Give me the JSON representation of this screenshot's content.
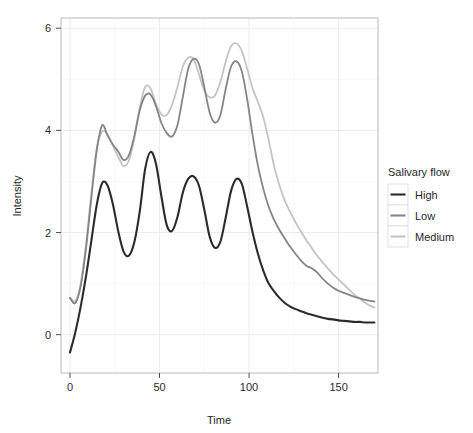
{
  "chart_data": {
    "type": "line",
    "title": "",
    "xlabel": "Time",
    "ylabel": "Intensity",
    "xlim": [
      -5,
      172
    ],
    "ylim": [
      -0.75,
      6.2
    ],
    "xticks": [
      0,
      50,
      100,
      150
    ],
    "yticks": [
      0,
      2,
      4,
      6
    ],
    "xtick_labels": [
      "0",
      "50",
      "100",
      "150"
    ],
    "ytick_labels": [
      "0",
      "2",
      "4",
      "6"
    ],
    "grid": true,
    "legend_position": "right",
    "legend_title": "Salivary flow",
    "colors": {
      "High": "#2b2b2b",
      "Low": "#858585",
      "Medium": "#c4c4c4"
    },
    "x": [
      0,
      3,
      6,
      9,
      12,
      15,
      18,
      21,
      24,
      27,
      30,
      33,
      36,
      39,
      42,
      45,
      48,
      51,
      54,
      57,
      60,
      63,
      66,
      69,
      72,
      75,
      78,
      81,
      84,
      87,
      90,
      93,
      96,
      99,
      102,
      105,
      108,
      111,
      114,
      117,
      120,
      123,
      126,
      129,
      132,
      135,
      138,
      141,
      144,
      147,
      150,
      153,
      156,
      159,
      162,
      165,
      168,
      170
    ],
    "series": [
      {
        "name": "High",
        "label": "High",
        "color": "#2b2b2b",
        "values": [
          -0.35,
          0.05,
          0.55,
          1.15,
          1.85,
          2.55,
          2.97,
          2.92,
          2.55,
          2.02,
          1.62,
          1.55,
          1.82,
          2.42,
          3.25,
          3.58,
          3.35,
          2.72,
          2.15,
          2.03,
          2.3,
          2.78,
          3.05,
          3.1,
          2.92,
          2.45,
          1.92,
          1.7,
          1.82,
          2.3,
          2.82,
          3.05,
          2.95,
          2.5,
          2.0,
          1.58,
          1.25,
          1.0,
          0.85,
          0.72,
          0.62,
          0.55,
          0.5,
          0.46,
          0.42,
          0.39,
          0.36,
          0.33,
          0.31,
          0.3,
          0.28,
          0.27,
          0.26,
          0.25,
          0.25,
          0.24,
          0.24,
          0.24
        ]
      },
      {
        "name": "Low",
        "label": "Low",
        "color": "#858585",
        "values": [
          0.72,
          0.62,
          0.95,
          1.7,
          2.7,
          3.62,
          4.1,
          3.9,
          3.72,
          3.58,
          3.42,
          3.52,
          3.9,
          4.4,
          4.68,
          4.7,
          4.48,
          4.15,
          3.95,
          3.88,
          4.1,
          4.65,
          5.2,
          5.4,
          5.3,
          4.85,
          4.35,
          4.15,
          4.3,
          4.82,
          5.25,
          5.35,
          5.15,
          4.6,
          3.9,
          3.3,
          2.85,
          2.5,
          2.25,
          2.05,
          1.88,
          1.72,
          1.58,
          1.45,
          1.35,
          1.3,
          1.22,
          1.1,
          1.0,
          0.92,
          0.86,
          0.82,
          0.78,
          0.74,
          0.71,
          0.68,
          0.66,
          0.65
        ]
      },
      {
        "name": "Medium",
        "label": "Medium",
        "color": "#c4c4c4",
        "values": [
          0.73,
          0.66,
          1.0,
          1.78,
          2.78,
          3.65,
          3.98,
          3.92,
          3.7,
          3.48,
          3.3,
          3.42,
          3.85,
          4.45,
          4.85,
          4.82,
          4.52,
          4.32,
          4.3,
          4.5,
          4.85,
          5.25,
          5.42,
          5.4,
          5.1,
          4.78,
          4.65,
          4.68,
          4.95,
          5.35,
          5.65,
          5.7,
          5.55,
          5.2,
          4.82,
          4.55,
          4.25,
          3.8,
          3.3,
          2.92,
          2.62,
          2.4,
          2.2,
          2.02,
          1.85,
          1.7,
          1.55,
          1.42,
          1.3,
          1.18,
          1.08,
          0.98,
          0.88,
          0.78,
          0.7,
          0.62,
          0.56,
          0.53
        ]
      }
    ]
  },
  "legend": {
    "title": "Salivary flow",
    "items": [
      {
        "label": "High",
        "color": "#2b2b2b"
      },
      {
        "label": "Low",
        "color": "#858585"
      },
      {
        "label": "Medium",
        "color": "#c4c4c4"
      }
    ]
  },
  "axes": {
    "x_title": "Time",
    "y_title": "Intensity",
    "x_tick_labels": [
      "0",
      "50",
      "100",
      "150"
    ],
    "y_tick_labels": [
      "0",
      "2",
      "4",
      "6"
    ]
  }
}
